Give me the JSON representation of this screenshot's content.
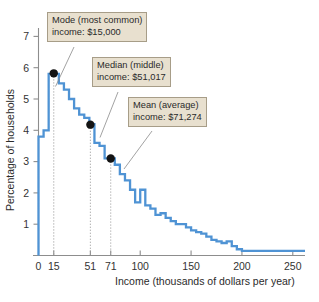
{
  "chart_data": {
    "type": "line",
    "title": "",
    "xlabel": "Income (thousands of dollars per year)",
    "ylabel": "Percentage of households",
    "xlim": [
      0,
      262
    ],
    "ylim": [
      0,
      7.6
    ],
    "grid": false,
    "legend_position": "none",
    "x_ticks": [
      {
        "value": 0,
        "label": "0"
      },
      {
        "value": 15,
        "label": "15"
      },
      {
        "value": 51,
        "label": "51"
      },
      {
        "value": 71,
        "label": "71"
      },
      {
        "value": 100,
        "label": "100"
      },
      {
        "value": 150,
        "label": "150"
      },
      {
        "value": 200,
        "label": "200"
      },
      {
        "value": 250,
        "label": "250"
      }
    ],
    "y_ticks": [
      {
        "value": 1,
        "label": "1"
      },
      {
        "value": 2,
        "label": "2"
      },
      {
        "value": 3,
        "label": "3"
      },
      {
        "value": 4,
        "label": "4"
      },
      {
        "value": 5,
        "label": "5"
      },
      {
        "value": 6,
        "label": "6"
      },
      {
        "value": 7,
        "label": "7"
      }
    ],
    "series": [
      {
        "name": "Percentage of households by income bracket",
        "style": "step",
        "color": "#4f93d4",
        "x": [
          0,
          5,
          10,
          15,
          20,
          25,
          30,
          35,
          40,
          45,
          50,
          55,
          60,
          65,
          70,
          75,
          80,
          85,
          90,
          95,
          100,
          105,
          110,
          115,
          120,
          125,
          130,
          135,
          140,
          145,
          150,
          155,
          160,
          165,
          170,
          175,
          180,
          185,
          190,
          195,
          200,
          250,
          262
        ],
        "values": [
          3.8,
          4.0,
          5.8,
          5.8,
          5.5,
          5.3,
          5.0,
          4.7,
          4.5,
          4.4,
          4.2,
          3.6,
          3.5,
          3.1,
          3.1,
          2.9,
          2.6,
          2.4,
          2.1,
          1.7,
          2.1,
          1.6,
          1.5,
          1.3,
          1.35,
          1.2,
          1.1,
          1.0,
          1.0,
          0.9,
          0.8,
          0.75,
          0.7,
          0.6,
          0.5,
          0.45,
          0.4,
          0.45,
          0.3,
          0.2,
          0.15,
          0.15,
          0.15
        ]
      }
    ],
    "markers": [
      {
        "name": "mode",
        "x": 15,
        "y": 5.82,
        "label": "Mode (most common)",
        "value_label": "income: $15,000"
      },
      {
        "name": "median",
        "x": 51,
        "y": 4.18,
        "label": "Median (middle)",
        "value_label": "income: $51,017"
      },
      {
        "name": "mean",
        "x": 71,
        "y": 3.1,
        "label": "Mean (average)",
        "value_label": "income: $71,274"
      }
    ],
    "guides": [
      15,
      51,
      71
    ]
  },
  "annotations": {
    "mode": {
      "line1": "Mode (most common)",
      "line2": "income: $15,000"
    },
    "median": {
      "line1": "Median (middle)",
      "line2": "income: $51,017"
    },
    "mean": {
      "line1": "Mean (average)",
      "line2": "income: $71,274"
    }
  },
  "axes": {
    "x_title": "Income (thousands of dollars per year)",
    "y_title": "Percentage of households"
  },
  "colors": {
    "curve": "#4f93d4",
    "callout_fill": "#e8e0cf",
    "callout_border": "#a79d88",
    "axis": "#8d8d8d",
    "marker": "#141414"
  }
}
